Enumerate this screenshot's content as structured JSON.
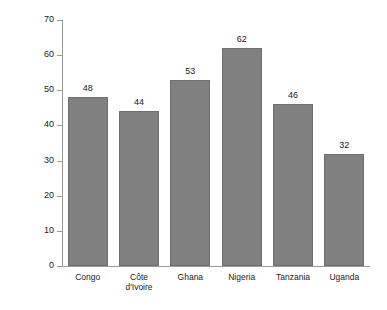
{
  "chart_data": {
    "type": "bar",
    "title": "",
    "subtitle": "",
    "xlabel": "",
    "ylabel": "Days per Ha",
    "categories": [
      "Congo",
      "Côte d'Ivoire",
      "Ghana",
      "Nigeria",
      "Tanzania",
      "Uganda"
    ],
    "category_lines": [
      [
        "Congo"
      ],
      [
        "Côte",
        "d'Ivoire"
      ],
      [
        "Ghana"
      ],
      [
        "Nigeria"
      ],
      [
        "Tanzania"
      ],
      [
        "Uganda"
      ]
    ],
    "values": [
      48,
      44,
      53,
      62,
      46,
      32
    ],
    "data_labels": [
      "48",
      "44",
      "53",
      "62",
      "46",
      "32"
    ],
    "ylim": [
      0,
      70
    ],
    "ytick_values": [
      0,
      10,
      20,
      30,
      40,
      50,
      60,
      70
    ],
    "ytick_labels": [
      "0",
      "10",
      "20",
      "30",
      "40",
      "50",
      "60",
      "70"
    ],
    "grid": false,
    "legend": null,
    "legend_position": "none",
    "bar_color": "#808080",
    "bar_edge_color": "#6f6f6f",
    "axis_color": "#9a9a9a",
    "background_color": "#ffffff",
    "text_color": "#1a1a1a"
  }
}
